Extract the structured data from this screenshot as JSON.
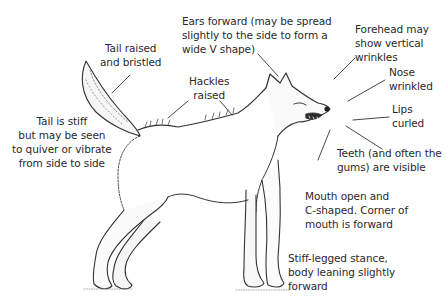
{
  "figure": {
    "labels": [
      {
        "id": "ears",
        "text": "Ears forward (may be spread\nslightly to the side to form a\nwide V shape)"
      },
      {
        "id": "forehead",
        "text": "Forehead may\nshow vertical\nwrinkles"
      },
      {
        "id": "tail-raised",
        "text": "Tail raised\nand bristled"
      },
      {
        "id": "hackles",
        "text": "Hackles\nraised"
      },
      {
        "id": "nose",
        "text": "Nose\nwrinkled"
      },
      {
        "id": "lips",
        "text": "Lips\ncurled"
      },
      {
        "id": "tail-stiff",
        "text": "Tail is stiff\nbut may be seen\nto quiver or vibrate\nfrom side to side"
      },
      {
        "id": "teeth",
        "text": "Teeth (and often the\ngums) are visible"
      },
      {
        "id": "mouth",
        "text": "Mouth open and\nC-shaped. Corner of\nmouth is forward"
      },
      {
        "id": "stance",
        "text": "Stiff-legged stance,\nbody leaning slightly\nforward"
      }
    ]
  },
  "colors": {
    "text": "#2a2a2a",
    "ink": "#333333",
    "background": "#ffffff"
  }
}
